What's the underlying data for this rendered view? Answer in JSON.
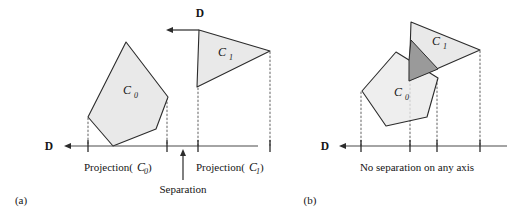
{
  "figure": {
    "colors": {
      "shape_fill": "#e9e9e9",
      "shape_stroke": "#2b2b2b",
      "overlap_fill": "#9a9a9a",
      "axis": "#4a4a4a",
      "dotted": "#6e6e6e",
      "text": "#151515",
      "background": "#ffffff"
    },
    "panels": [
      {
        "id": "a",
        "panel_label": "(a)",
        "direction_labels": [
          {
            "name": "direction-top",
            "text": "D"
          },
          {
            "name": "direction-axis",
            "text": "D"
          }
        ],
        "shapes": [
          {
            "name": "polygon-c0",
            "label": "C",
            "subscript": "0",
            "kind": "pentagon"
          },
          {
            "name": "polygon-c1",
            "label": "C",
            "subscript": "1",
            "kind": "triangle"
          }
        ],
        "projection_labels": [
          {
            "name": "projection-c0",
            "prefix": "Projection(",
            "label": "C",
            "subscript": "0",
            "suffix": ")"
          },
          {
            "name": "projection-c1",
            "prefix": "Projection(",
            "label": "C",
            "subscript": "1",
            "suffix": ")"
          }
        ],
        "annotation": "Separation"
      },
      {
        "id": "b",
        "panel_label": "(b)",
        "direction_labels": [
          {
            "name": "direction-axis",
            "text": "D"
          }
        ],
        "shapes": [
          {
            "name": "polygon-c0",
            "label": "C",
            "subscript": "0",
            "kind": "pentagon"
          },
          {
            "name": "polygon-c1",
            "label": "C",
            "subscript": "1",
            "kind": "triangle"
          },
          {
            "name": "polygon-overlap",
            "label": "",
            "subscript": "",
            "kind": "intersection"
          }
        ],
        "projection_labels": [],
        "annotation": "No separation on any axis"
      }
    ]
  }
}
